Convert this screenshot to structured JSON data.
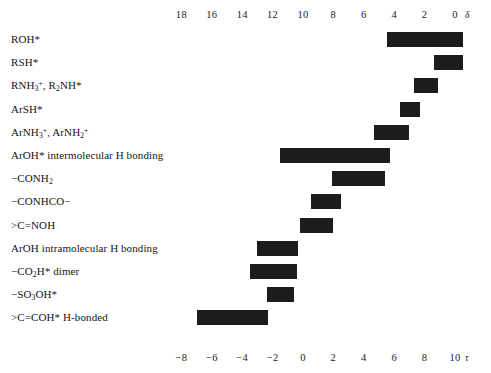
{
  "chart_data": {
    "type": "bar",
    "orientation": "horizontal-range",
    "title": "",
    "xlabel_top": "δ",
    "xlabel_bottom": "τ",
    "grid": false,
    "legend": "none",
    "axis_top": {
      "name": "delta",
      "unit": "δ",
      "reversed": true,
      "range": [
        19,
        -0.7
      ],
      "ticks": [
        18,
        16,
        14,
        12,
        10,
        8,
        6,
        4,
        2,
        0
      ],
      "tick_labels": [
        "18",
        "16",
        "14",
        "12",
        "10",
        "8",
        "6",
        "4",
        "2",
        "0"
      ]
    },
    "axis_bottom": {
      "name": "tau",
      "unit": "τ",
      "reversed": false,
      "range": [
        -9,
        10.7
      ],
      "ticks": [
        -8,
        -6,
        -4,
        -2,
        0,
        2,
        4,
        6,
        8,
        10
      ],
      "tick_labels": [
        "−8",
        "−6",
        "−4",
        "−2",
        "0",
        "2",
        "4",
        "6",
        "8",
        "10"
      ]
    },
    "relation": "tau = 10 - delta",
    "categories": [
      "ROH*",
      "RSH*",
      "RNH3+, R2NH*",
      "ArSH*",
      "ArNH3+, ArNH2+",
      "ArOH* intermolecular H bonding",
      "-CONH2",
      "-CONHCO-",
      ">C=NOH",
      "ArOH intramolecular H bonding",
      "-CO2H* dimer",
      "-SO3OH*",
      ">C=COH* H-bonded"
    ],
    "ranges_delta": [
      [
        -0.5,
        4.5
      ],
      [
        -0.5,
        1.4
      ],
      [
        1.1,
        2.7
      ],
      [
        2.3,
        3.6
      ],
      [
        3.0,
        5.3
      ],
      [
        4.3,
        11.5
      ],
      [
        4.6,
        8.1
      ],
      [
        7.5,
        9.5
      ],
      [
        8.0,
        10.2
      ],
      [
        10.3,
        13.0
      ],
      [
        10.4,
        13.5
      ],
      [
        10.6,
        12.4
      ],
      [
        12.3,
        17.0
      ]
    ]
  },
  "rows": [
    {
      "label_html": "ROH*",
      "delta_lo": -0.5,
      "delta_hi": 4.5
    },
    {
      "label_html": "RSH*",
      "delta_lo": -0.5,
      "delta_hi": 1.4
    },
    {
      "label_html": "RNH<sub>3</sub><sup>+</sup>, R<sub>2</sub>NH*",
      "delta_lo": 1.1,
      "delta_hi": 2.7
    },
    {
      "label_html": "ArSH*",
      "delta_lo": 2.3,
      "delta_hi": 3.6
    },
    {
      "label_html": "ArNH<sub>3</sub><sup>+</sup>, ArNH<sub>2</sub><sup>+</sup>",
      "delta_lo": 3.0,
      "delta_hi": 5.3
    },
    {
      "label_html": "ArOH* intermolecular H bonding",
      "delta_lo": 4.3,
      "delta_hi": 11.5
    },
    {
      "label_html": "&minus;CONH<sub>2</sub>",
      "delta_lo": 4.6,
      "delta_hi": 8.1
    },
    {
      "label_html": "&minus;CONHCO&minus;",
      "delta_lo": 7.5,
      "delta_hi": 9.5
    },
    {
      "label_html": "&gt;C=NOH",
      "delta_lo": 8.0,
      "delta_hi": 10.2
    },
    {
      "label_html": "ArOH intramolecular H bonding",
      "delta_lo": 10.3,
      "delta_hi": 13.0
    },
    {
      "label_html": "&minus;CO<sub>2</sub>H* dimer",
      "delta_lo": 10.4,
      "delta_hi": 13.5
    },
    {
      "label_html": "&minus;SO<sub>3</sub>OH*",
      "delta_lo": 10.6,
      "delta_hi": 12.4
    },
    {
      "label_html": "&gt;C=COH* H-bonded",
      "delta_lo": 12.3,
      "delta_hi": 17.0
    }
  ],
  "colors": {
    "bar": "#1c1c1c",
    "text": "#141414",
    "background": "#ffffff"
  }
}
